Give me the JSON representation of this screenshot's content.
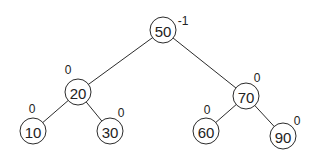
{
  "diagram": {
    "type": "binary-search-tree",
    "colors": {
      "stroke": "#2b2b2b",
      "text": "#222222",
      "background": "#ffffff"
    },
    "nodes": [
      {
        "id": "n50",
        "value": "50",
        "balance": "-1",
        "cx": 163,
        "cy": 30,
        "bx": 183,
        "by": 21
      },
      {
        "id": "n20",
        "value": "20",
        "balance": "0",
        "cx": 78,
        "cy": 92,
        "bx": 68,
        "by": 70
      },
      {
        "id": "n70",
        "value": "70",
        "balance": "0",
        "cx": 246,
        "cy": 96,
        "bx": 257,
        "by": 78
      },
      {
        "id": "n10",
        "value": "10",
        "balance": "0",
        "cx": 33,
        "cy": 131,
        "bx": 32,
        "by": 109
      },
      {
        "id": "n30",
        "value": "30",
        "balance": "0",
        "cx": 110,
        "cy": 131,
        "bx": 121,
        "by": 113
      },
      {
        "id": "n60",
        "value": "60",
        "balance": "0",
        "cx": 206,
        "cy": 131,
        "bx": 207,
        "by": 110
      },
      {
        "id": "n90",
        "value": "90",
        "balance": "0",
        "cx": 283,
        "cy": 136,
        "bx": 297,
        "by": 121
      }
    ],
    "edges": [
      {
        "from": "n50",
        "to": "n20"
      },
      {
        "from": "n50",
        "to": "n70"
      },
      {
        "from": "n20",
        "to": "n10"
      },
      {
        "from": "n20",
        "to": "n30"
      },
      {
        "from": "n70",
        "to": "n60"
      },
      {
        "from": "n70",
        "to": "n90"
      }
    ]
  }
}
